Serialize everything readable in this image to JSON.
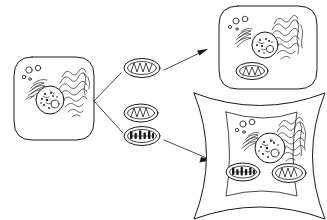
{
  "figure": {
    "background_color": "#ffffff",
    "ink_color": "#1a1a1a",
    "width": 327,
    "height": 220,
    "style": "hand-drawn line art, no labels or text"
  },
  "source_cell": {
    "name": "donor cell",
    "shape": "rounded-square",
    "position": {
      "x": 14,
      "y": 57,
      "width": 80,
      "height": 83
    },
    "organelles": {
      "nucleus": {
        "label": "nucleus",
        "cx": 50,
        "cy": 100,
        "r": 14,
        "chromatin_dots": 9,
        "nucleolus": {
          "cx": 55,
          "cy": 104,
          "r": 4
        }
      },
      "endoplasmic_reticulum": {
        "label": "rough ER",
        "count": 2,
        "side": "left-and-right"
      },
      "golgi": {
        "label": "golgi apparatus",
        "count": 1
      },
      "vesicles": {
        "label": "vesicles",
        "count": 4,
        "radii": [
          3,
          2.6,
          1.6,
          1.3
        ]
      }
    }
  },
  "transferred_mitochondria": [
    {
      "name": "mitochondrion-top",
      "cristae_style": "zigzag",
      "position": {
        "cx": 142,
        "cy": 68,
        "rx": 18,
        "ry": 9.5
      },
      "destination": "rounded cell"
    },
    {
      "name": "mitochondrion-middle",
      "cristae_style": "zigzag",
      "position": {
        "cx": 141,
        "cy": 113,
        "rx": 17,
        "ry": 9
      },
      "destination": "none"
    },
    {
      "name": "mitochondrion-bottom",
      "cristae_style": "dense-blocky",
      "position": {
        "cx": 142,
        "cy": 136,
        "rx": 18,
        "ry": 9.5
      },
      "destination": "star-shaped cell"
    }
  ],
  "connectors": {
    "branch": {
      "name": "branching-bracket",
      "description": "V-shaped bracket leaving the donor cell and splitting toward the top and bottom mitochondria",
      "origin": {
        "x": 94,
        "y": 101
      }
    },
    "arrows": [
      {
        "name": "arrow-to-rounded-cell",
        "from": {
          "x": 163,
          "y": 70
        },
        "to": {
          "x": 207,
          "y": 49
        },
        "direction": "up-right",
        "head": "filled"
      },
      {
        "name": "arrow-to-star-cell",
        "from": {
          "x": 163,
          "y": 140
        },
        "to": {
          "x": 211,
          "y": 160
        },
        "direction": "down-right",
        "head": "filled"
      }
    ]
  },
  "target_cells": [
    {
      "name": "rounded-target-cell",
      "shape": "rounded-square",
      "position": {
        "x": 219,
        "y": 6,
        "width": 98,
        "height": 83
      },
      "organelles": {
        "nucleus": {
          "label": "nucleus",
          "cx": 265,
          "cy": 45,
          "r": 13,
          "chromatin_dots": 8,
          "nucleolus": {
            "cx": 270,
            "cy": 49,
            "r": 3.6
          }
        },
        "endoplasmic_reticulum": {
          "label": "rough ER",
          "count": 2
        },
        "golgi": {
          "label": "golgi apparatus",
          "count": 1
        },
        "vesicles": {
          "label": "vesicles",
          "count": 4
        },
        "mitochondria": [
          {
            "name": "received-mitochondrion",
            "cristae_style": "zigzag",
            "cx": 252,
            "cy": 71,
            "rx": 16,
            "ry": 8.5
          }
        ]
      }
    },
    {
      "name": "star-shaped-target-cell",
      "shape": "concave-sided (cell wall with pointed corners)",
      "position": {
        "x": 192,
        "y": 92,
        "width": 135,
        "height": 128
      },
      "organelles": {
        "nucleus": {
          "label": "nucleus",
          "cx": 270,
          "cy": 148,
          "r": 15,
          "chromatin_dots": 9,
          "nucleolus": {
            "cx": 275,
            "cy": 153,
            "r": 4
          }
        },
        "endoplasmic_reticulum": {
          "label": "rough ER",
          "count": 2
        },
        "golgi": {
          "label": "golgi apparatus",
          "count": 1
        },
        "vesicles": {
          "label": "vesicles",
          "count": 4
        },
        "mitochondria": [
          {
            "name": "resident-mitochondrion-dense",
            "cristae_style": "dense-blocky",
            "cx": 243,
            "cy": 172,
            "rx": 17,
            "ry": 9
          },
          {
            "name": "received-mitochondrion-zigzag",
            "cristae_style": "zigzag",
            "cx": 289,
            "cy": 173,
            "rx": 17,
            "ry": 9.5
          }
        ]
      }
    }
  ]
}
